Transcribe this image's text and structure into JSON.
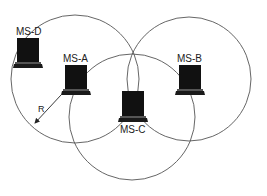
{
  "diagram": {
    "type": "wireless-range-overlap",
    "colors": {
      "background": "#ffffff",
      "circle_stroke": "#555555",
      "device_fill": "#111111",
      "text": "#222222"
    },
    "nodes": [
      {
        "id": "ms-d",
        "label": "MS-D",
        "icon": "laptop-icon"
      },
      {
        "id": "ms-a",
        "label": "MS-A",
        "icon": "laptop-icon"
      },
      {
        "id": "ms-b",
        "label": "MS-B",
        "icon": "laptop-icon"
      },
      {
        "id": "ms-c",
        "label": "MS-C",
        "icon": "laptop-icon"
      }
    ],
    "ranges": [
      {
        "center_node": "MS-A",
        "shape": "circle"
      },
      {
        "center_node": "MS-B",
        "shape": "circle"
      },
      {
        "center_node": "MS-C",
        "shape": "circle"
      }
    ],
    "radius": {
      "label": "R",
      "from_node": "MS-A",
      "icon": "arrow-icon"
    }
  }
}
